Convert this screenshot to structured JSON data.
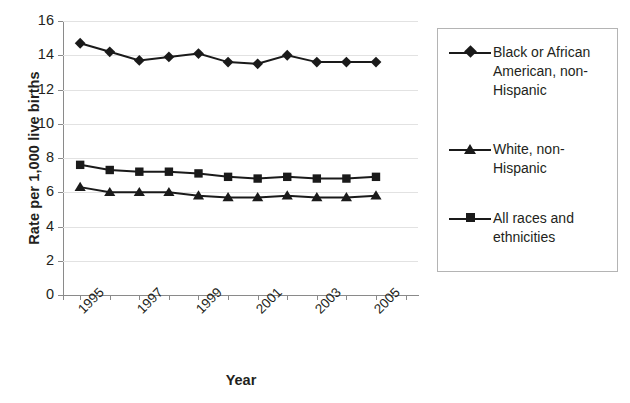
{
  "chart_data": {
    "type": "line",
    "title": "",
    "xlabel": "Year",
    "ylabel": "Rate per 1,000 live births",
    "x": [
      1995,
      1996,
      1997,
      1998,
      1999,
      2000,
      2001,
      2002,
      2003,
      2004,
      2005
    ],
    "xlim": [
      1994.5,
      2006.5
    ],
    "ylim": [
      0,
      16
    ],
    "ytick_labels": [
      "16",
      "14",
      "12",
      "10",
      "8",
      "6",
      "4",
      "2",
      "0"
    ],
    "ytick_values": [
      16,
      14,
      12,
      10,
      8,
      6,
      4,
      2,
      0
    ],
    "xtick_labels": [
      "1995",
      "",
      "1997",
      "",
      "1999",
      "",
      "2001",
      "",
      "2003",
      "",
      "2005",
      ""
    ],
    "grid": true,
    "legend_position": "right",
    "series": [
      {
        "name": "Black or African American, non-Hispanic",
        "marker": "diamond",
        "values": [
          14.7,
          14.2,
          13.7,
          13.9,
          14.1,
          13.6,
          13.5,
          14.0,
          13.6,
          13.6,
          13.6
        ]
      },
      {
        "name": "White, non-Hispanic",
        "marker": "triangle",
        "values": [
          6.3,
          6.0,
          6.0,
          6.0,
          5.8,
          5.7,
          5.7,
          5.8,
          5.7,
          5.7,
          5.8
        ]
      },
      {
        "name": "All races and ethnicities",
        "marker": "square",
        "values": [
          7.6,
          7.3,
          7.2,
          7.2,
          7.1,
          6.9,
          6.8,
          6.9,
          6.8,
          6.8,
          6.9
        ]
      }
    ]
  },
  "axes": {
    "y_title": "Rate per 1,000 live births",
    "x_title": "Year"
  },
  "legend": {
    "entries": [
      {
        "label": "Black or African American, non-Hispanic",
        "marker": "diamond"
      },
      {
        "label": "White, non-Hispanic",
        "marker": "triangle"
      },
      {
        "label": "All races and ethnicities",
        "marker": "square"
      }
    ]
  },
  "colors": {
    "series": "#1a1a1a",
    "grid": "#e2e2e2",
    "axis": "#8a8a8a",
    "text": "#231f20",
    "legend_border": "#b4b4b4"
  }
}
